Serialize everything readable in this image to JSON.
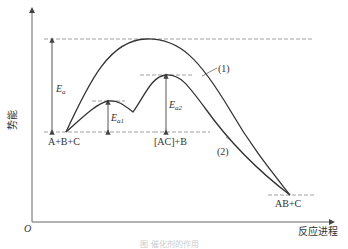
{
  "diagram": {
    "title": "",
    "y_axis_label": "势能",
    "x_axis_label": "反应进程",
    "origin_label": "O",
    "states": {
      "reactants": "A+B+C",
      "intermediate": "[AC]+B",
      "products": "AB+C"
    },
    "energy_labels": {
      "ea": "E",
      "ea_sub": "a",
      "ea1": "E",
      "ea1_sub": "a1",
      "ea2": "E",
      "ea2_sub": "a2"
    },
    "curves": [
      {
        "id": "1",
        "label": "(1)",
        "description": "uncatalyzed path, single high barrier"
      },
      {
        "id": "2",
        "label": "(2)",
        "description": "catalyzed path, two lower barriers via [AC] intermediate"
      }
    ],
    "caption": "图  催化剂的作用"
  }
}
